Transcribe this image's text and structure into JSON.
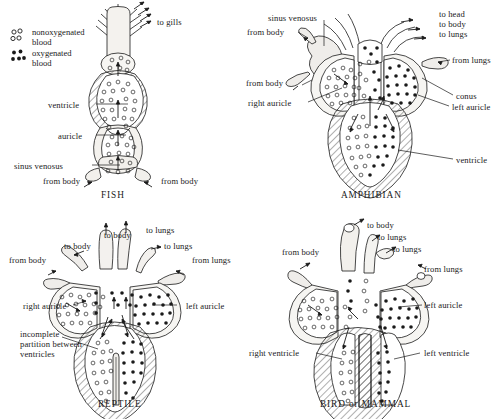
{
  "figure": {
    "ink_color": "#1a1a1a",
    "fill_light": "#f2f0ec",
    "fill_lighter": "#f7f6f3"
  },
  "legend": {
    "items": [
      {
        "id": "nonoxygenated",
        "symbol": "open-circles",
        "line1": "nonoxygenated",
        "line2": "blood"
      },
      {
        "id": "oxygenated",
        "symbol": "filled-dots",
        "line1": "oxygenated",
        "line2": "blood"
      }
    ]
  },
  "panels": [
    {
      "id": "fish",
      "caption": "FISH",
      "blood": "nonoxygenated-only",
      "labels": [
        {
          "id": "to-gills",
          "text": "to gills",
          "x": 157,
          "y": 17
        },
        {
          "id": "ventricle",
          "text": "ventricle",
          "x": 48,
          "y": 100
        },
        {
          "id": "auricle",
          "text": "auricle",
          "x": 58,
          "y": 131
        },
        {
          "id": "sinus-venosus",
          "text": "sinus venosus",
          "x": 14,
          "y": 161
        },
        {
          "id": "from-body-left",
          "text": "from body",
          "x": 43,
          "y": 176
        },
        {
          "id": "from-body-right",
          "text": "from body",
          "x": 161,
          "y": 176
        }
      ]
    },
    {
      "id": "amphibian",
      "caption": "AMPHIBIAN",
      "blood": "mixed",
      "labels": [
        {
          "id": "sinus-venosus",
          "text": "sinus venosus",
          "x": 22,
          "y": 13
        },
        {
          "id": "from-body-upper",
          "text": "from body",
          "x": 1,
          "y": 27
        },
        {
          "id": "to-head",
          "text": "to head",
          "x": 193,
          "y": 9
        },
        {
          "id": "to-body",
          "text": "to body",
          "x": 193,
          "y": 19
        },
        {
          "id": "to-lungs",
          "text": "to lungs",
          "x": 193,
          "y": 29
        },
        {
          "id": "from-lungs",
          "text": "from lungs",
          "x": 206,
          "y": 55
        },
        {
          "id": "from-body-lower",
          "text": "from body",
          "x": 0,
          "y": 78
        },
        {
          "id": "right-auricle",
          "text": "right auricle",
          "x": 2,
          "y": 98
        },
        {
          "id": "conus",
          "text": "conus",
          "x": 210,
          "y": 91
        },
        {
          "id": "left-auricle",
          "text": "left auricle",
          "x": 206,
          "y": 102
        },
        {
          "id": "ventricle",
          "text": "ventricle",
          "x": 210,
          "y": 155
        }
      ]
    },
    {
      "id": "reptile",
      "caption": "REPTILE",
      "blood": "mixed-partial-septum",
      "labels": [
        {
          "id": "to-body-left",
          "text": "to body",
          "x": 64,
          "y": 32
        },
        {
          "id": "to-body-mid",
          "text": "to body",
          "x": 104,
          "y": 21
        },
        {
          "id": "to-lungs-mid",
          "text": "to lungs",
          "x": 146,
          "y": 16
        },
        {
          "id": "to-lungs-right",
          "text": "to lungs",
          "x": 164,
          "y": 32
        },
        {
          "id": "from-body",
          "text": "from body",
          "x": 9,
          "y": 46
        },
        {
          "id": "from-lungs",
          "text": "from lungs",
          "x": 192,
          "y": 46
        },
        {
          "id": "right-auricle",
          "text": "right auricle",
          "x": 23,
          "y": 92
        },
        {
          "id": "left-auricle",
          "text": "left auricle",
          "x": 186,
          "y": 92
        },
        {
          "id": "incomplete-partition",
          "text": "incomplete partition between ventricles",
          "x": 20,
          "y": 120,
          "multiline": true
        }
      ]
    },
    {
      "id": "bird-mammal",
      "caption": "BIRD or MAMMAL",
      "blood": "fully-separated",
      "labels": [
        {
          "id": "to-body",
          "text": "to body",
          "x": 121,
          "y": 11
        },
        {
          "id": "to-lungs-upper",
          "text": "to lungs",
          "x": 132,
          "y": 23
        },
        {
          "id": "to-lungs-lower",
          "text": "to lungs",
          "x": 147,
          "y": 35
        },
        {
          "id": "from-body",
          "text": "from body",
          "x": 36,
          "y": 38
        },
        {
          "id": "from-lungs",
          "text": "from lungs",
          "x": 178,
          "y": 55
        },
        {
          "id": "left-auricle",
          "text": "left auricle",
          "x": 178,
          "y": 91
        },
        {
          "id": "right-ventricle",
          "text": "right ventricle",
          "x": 3,
          "y": 139
        },
        {
          "id": "left-ventricle",
          "text": "left ventricle",
          "x": 178,
          "y": 139
        }
      ]
    }
  ]
}
